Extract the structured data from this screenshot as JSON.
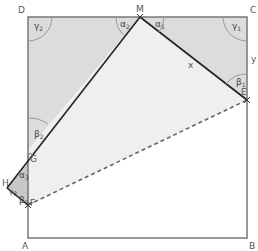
{
  "diagram": {
    "type": "geometry-folded-square",
    "points": {
      "A": "A",
      "B": "B",
      "C": "C",
      "D": "D",
      "M": "M",
      "E": "E",
      "G": "G",
      "H": "H",
      "F": "F"
    },
    "segment_labels": {
      "ME": "x",
      "CE": "y"
    },
    "angles": {
      "gamma2": {
        "sym": "γ",
        "sub": "2"
      },
      "alpha2": {
        "sym": "α",
        "sub": "2"
      },
      "alpha1": {
        "sym": "α",
        "sub": "1"
      },
      "gamma1": {
        "sym": "γ",
        "sub": "1"
      },
      "beta1": {
        "sym": "β",
        "sub": "1"
      },
      "beta2": {
        "sym": "β",
        "sub": "2"
      },
      "alpha3": {
        "sym": "α",
        "sub": "3"
      },
      "gamma3": {
        "sym": "γ",
        "sub": "3"
      },
      "beta3": {
        "sym": "β",
        "sub": "3"
      }
    },
    "colors": {
      "shade_dark": "#d9d9d9",
      "shade_light": "#ececec",
      "line": "#222222",
      "square": "#777777",
      "arc": "#999999"
    }
  }
}
